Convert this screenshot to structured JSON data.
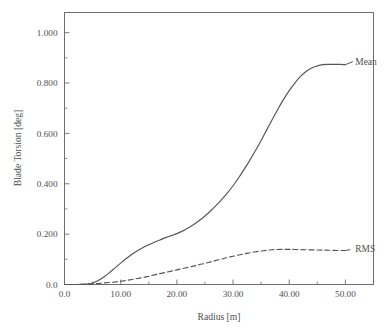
{
  "chart_data": {
    "type": "line",
    "title": "",
    "xlabel": "Radius [m]",
    "ylabel": "Blade Torsion [deg]",
    "xlim": [
      0.0,
      55.0
    ],
    "ylim": [
      0.0,
      1.08
    ],
    "grid": false,
    "legend_position": "inline-right-annotations",
    "x_ticks": [
      0.0,
      10.0,
      20.0,
      30.0,
      40.0,
      50.0
    ],
    "x_tick_labels": [
      "0.0",
      "10.00",
      "20.00",
      "30.00",
      "40.00",
      "50.00"
    ],
    "x_minor_ticks": [
      5.0,
      15.0,
      25.0,
      35.0,
      45.0,
      55.0
    ],
    "y_ticks": [
      0.0,
      0.2,
      0.4,
      0.6,
      0.8,
      1.0
    ],
    "y_tick_labels": [
      "0.0",
      "0.200",
      "0.400",
      "0.600",
      "0.800",
      "1.000"
    ],
    "y_minor_ticks": [
      0.1,
      0.3,
      0.5,
      0.7,
      0.9
    ],
    "series": [
      {
        "name": "Mean",
        "style": "solid",
        "color": "#555555",
        "label_x": 51.5,
        "label_y": 0.885,
        "x": [
          0.0,
          2.0,
          4.0,
          5.0,
          6.0,
          7.0,
          8.0,
          9.0,
          10.0,
          11.0,
          12.0,
          13.0,
          14.0,
          15.0,
          16.0,
          17.0,
          18.0,
          19.0,
          20.0,
          21.0,
          22.0,
          23.0,
          24.0,
          25.0,
          26.0,
          27.0,
          28.0,
          29.0,
          30.0,
          31.0,
          32.0,
          33.0,
          34.0,
          35.0,
          36.0,
          37.0,
          38.0,
          39.0,
          40.0,
          41.0,
          42.0,
          43.0,
          44.0,
          45.0,
          46.0,
          47.0,
          48.0,
          49.0,
          50.0
        ],
        "y": [
          0.0,
          0.0,
          0.002,
          0.006,
          0.016,
          0.03,
          0.047,
          0.066,
          0.085,
          0.103,
          0.12,
          0.134,
          0.147,
          0.158,
          0.168,
          0.177,
          0.186,
          0.194,
          0.202,
          0.212,
          0.224,
          0.238,
          0.254,
          0.272,
          0.292,
          0.314,
          0.338,
          0.364,
          0.392,
          0.424,
          0.458,
          0.494,
          0.532,
          0.572,
          0.614,
          0.656,
          0.697,
          0.735,
          0.77,
          0.8,
          0.826,
          0.846,
          0.86,
          0.868,
          0.873,
          0.874,
          0.874,
          0.874,
          0.873
        ]
      },
      {
        "name": "RMS",
        "style": "dashed",
        "color": "#555555",
        "label_x": 51.5,
        "label_y": 0.14,
        "x": [
          0.0,
          2.0,
          4.0,
          5.0,
          6.0,
          7.0,
          8.0,
          9.0,
          10.0,
          11.0,
          12.0,
          13.0,
          14.0,
          15.0,
          16.0,
          17.0,
          18.0,
          19.0,
          20.0,
          21.0,
          22.0,
          23.0,
          24.0,
          25.0,
          26.0,
          27.0,
          28.0,
          29.0,
          30.0,
          31.0,
          32.0,
          33.0,
          34.0,
          35.0,
          36.0,
          37.0,
          38.0,
          39.0,
          40.0,
          41.0,
          42.0,
          43.0,
          44.0,
          45.0,
          46.0,
          47.0,
          48.0,
          49.0,
          50.0
        ],
        "y": [
          0.0,
          0.0,
          0.001,
          0.002,
          0.004,
          0.006,
          0.008,
          0.01,
          0.013,
          0.016,
          0.02,
          0.024,
          0.028,
          0.033,
          0.038,
          0.043,
          0.048,
          0.053,
          0.058,
          0.063,
          0.068,
          0.073,
          0.079,
          0.084,
          0.09,
          0.096,
          0.101,
          0.107,
          0.112,
          0.117,
          0.122,
          0.126,
          0.13,
          0.133,
          0.136,
          0.138,
          0.139,
          0.1395,
          0.1395,
          0.139,
          0.1385,
          0.138,
          0.1375,
          0.137,
          0.1365,
          0.136,
          0.1355,
          0.135,
          0.135
        ]
      }
    ]
  },
  "figure": {
    "background_color": "#ffffff",
    "axis_color": "#6e6e6e",
    "text_color": "#4f4f4f"
  }
}
